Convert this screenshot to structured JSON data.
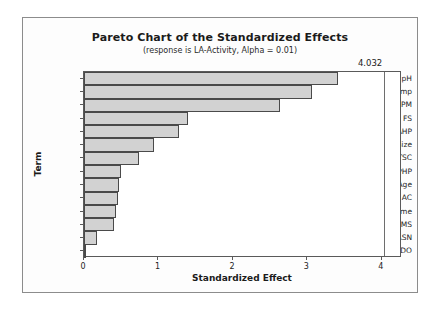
{
  "chart_data": {
    "type": "bar",
    "orientation": "horizontal",
    "title": "Pareto Chart of the Standardized Effects",
    "subtitle": "(response is LA-Activity, Alpha = 0.01)",
    "xlabel": "Standardized Effect",
    "ylabel": "Term",
    "categories": [
      "pH",
      "Temp",
      "RPM",
      "FS",
      "DAHP",
      "Inn Size",
      "TSC",
      "DPHP",
      "Inn Age",
      "AC",
      "Time",
      "MS",
      "L-ASN",
      "DO"
    ],
    "values": [
      3.41,
      3.06,
      2.63,
      1.4,
      1.27,
      0.94,
      0.74,
      0.5,
      0.47,
      0.46,
      0.43,
      0.4,
      0.17,
      0.03
    ],
    "xticks": [
      "0",
      "1",
      "2",
      "3",
      "4"
    ],
    "xtick_values": [
      0,
      1,
      2,
      3,
      4
    ],
    "xlim": [
      0,
      4.27
    ],
    "grid": false,
    "legend": false,
    "reference_line": {
      "label": "4.032",
      "value": 4.032
    },
    "colors": {
      "bar_fill": "#d2d2d2",
      "bar_border": "#4a4a4a",
      "axis": "#5a5a5a",
      "text": "#1b1b1b",
      "reference_line": "#6e6e6e",
      "frame": "#8c8c8c",
      "background": "#fdfdfd"
    }
  }
}
